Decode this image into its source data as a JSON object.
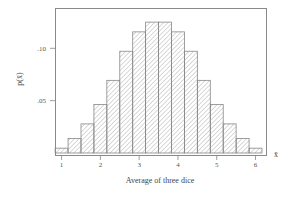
{
  "chart_data": {
    "type": "bar",
    "title": "",
    "xlabel": "Average of three dice",
    "ylabel": "p(x̄)",
    "x_axis_symbol": "x̄",
    "x": [
      1.0,
      1.333,
      1.667,
      2.0,
      2.333,
      2.667,
      3.0,
      3.333,
      3.667,
      4.0,
      4.333,
      4.667,
      5.0,
      5.333,
      5.667,
      6.0
    ],
    "values": [
      0.0046,
      0.0139,
      0.0278,
      0.0463,
      0.0694,
      0.0972,
      0.1157,
      0.125,
      0.125,
      0.1157,
      0.0972,
      0.0694,
      0.0463,
      0.0278,
      0.0139,
      0.0046
    ],
    "xlim": [
      0.83,
      6.27
    ],
    "ylim": [
      0,
      0.1385
    ],
    "xticks": [
      1,
      2,
      3,
      4,
      5,
      6
    ],
    "xtick_labels": [
      "1",
      "2",
      "3",
      "4",
      "5",
      "6"
    ],
    "yticks": [
      0.05,
      0.1
    ],
    "ytick_labels": [
      ".05",
      ".10"
    ],
    "bar_fill": "diagonal hatch",
    "colors": {
      "bar_edge": "#888888",
      "hatch": "#9a9a9a",
      "frame": "#888888"
    },
    "grid": false,
    "legend": "none"
  }
}
